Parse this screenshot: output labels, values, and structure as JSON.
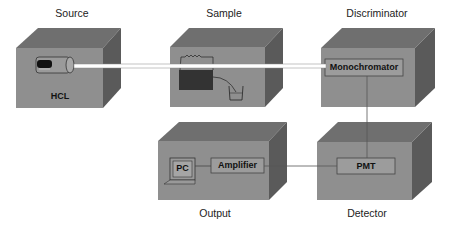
{
  "diagram": {
    "colors": {
      "front": "#8f8f8f",
      "top": "#6e6e6e",
      "side": "#5a5a5a",
      "beam": "#ffffff",
      "wire": "#555555"
    },
    "blocks": [
      {
        "id": "source",
        "label": "Source",
        "component": "HCL"
      },
      {
        "id": "sample",
        "label": "Sample",
        "component": "atomizer"
      },
      {
        "id": "discriminator",
        "label": "Discriminator",
        "component": "Monochromator"
      },
      {
        "id": "output",
        "label": "Output",
        "components": [
          "PC",
          "Amplifier"
        ]
      },
      {
        "id": "detector",
        "label": "Detector",
        "component": "PMT"
      }
    ],
    "connections": [
      {
        "from": "source",
        "to": "sample",
        "type": "light-beam"
      },
      {
        "from": "sample",
        "to": "discriminator",
        "type": "light-beam"
      },
      {
        "from": "discriminator",
        "to": "detector",
        "type": "wire"
      },
      {
        "from": "detector",
        "to": "output",
        "type": "wire"
      },
      {
        "from": "Amplifier",
        "to": "PC",
        "type": "wire"
      }
    ]
  },
  "labels": {
    "source": "Source",
    "sample": "Sample",
    "discriminator": "Discriminator",
    "output": "Output",
    "detector": "Detector",
    "hcl": "HCL",
    "monochromator": "Monochromator",
    "pmt": "PMT",
    "amplifier": "Amplifier",
    "pc": "PC"
  }
}
